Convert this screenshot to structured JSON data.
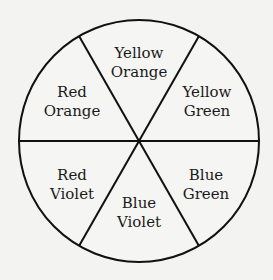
{
  "diagram": {
    "type": "color-wheel",
    "segments": [
      {
        "line1": "Yellow",
        "line2": "Orange"
      },
      {
        "line1": "Yellow",
        "line2": "Green"
      },
      {
        "line1": "Blue",
        "line2": "Green"
      },
      {
        "line1": "Blue",
        "line2": "Violet"
      },
      {
        "line1": "Red",
        "line2": "Violet"
      },
      {
        "line1": "Red",
        "line2": "Orange"
      }
    ],
    "colors": {
      "stroke": "#111111",
      "background": "#f3f3f1"
    }
  }
}
